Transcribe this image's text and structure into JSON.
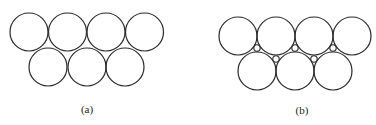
{
  "panels": [
    {
      "id": "a",
      "label": "(a)",
      "label_pos": [
        87,
        109
      ],
      "radius": 19,
      "top_row": {
        "cy": 32,
        "cx": [
          29,
          67.5,
          106,
          144.5
        ]
      },
      "bottom_row": {
        "cy": 67,
        "cx": [
          48,
          87,
          125
        ]
      },
      "interstitial": []
    },
    {
      "id": "b",
      "label": "(b)",
      "label_pos": [
        302,
        110
      ],
      "radius": 19,
      "top_row": {
        "cy": 36,
        "cx": [
          238,
          276,
          314,
          352
        ]
      },
      "bottom_row": {
        "cy": 71,
        "cx": [
          257,
          295,
          333
        ]
      },
      "interstitial": [
        {
          "cx": 257,
          "cy": 48,
          "r": 3.2
        },
        {
          "cx": 276,
          "cy": 59,
          "r": 3.2
        },
        {
          "cx": 295,
          "cy": 48,
          "r": 3.2
        },
        {
          "cx": 314,
          "cy": 59,
          "r": 3.2
        },
        {
          "cx": 333,
          "cy": 48,
          "r": 3.2
        }
      ]
    }
  ]
}
